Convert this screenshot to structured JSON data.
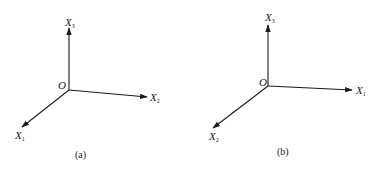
{
  "panels": [
    {
      "id": "a",
      "caption": "(a)",
      "origin_label": "O",
      "axes": [
        {
          "letter": "X",
          "subscript": "3",
          "direction": "up"
        },
        {
          "letter": "X",
          "subscript": "2",
          "direction": "right"
        },
        {
          "letter": "X",
          "subscript": "1",
          "direction": "down-left"
        }
      ]
    },
    {
      "id": "b",
      "caption": "(b)",
      "origin_label": "O",
      "axes": [
        {
          "letter": "X",
          "subscript": "3",
          "direction": "up"
        },
        {
          "letter": "X",
          "subscript": "1",
          "direction": "right"
        },
        {
          "letter": "X",
          "subscript": "2",
          "direction": "down-left"
        }
      ]
    }
  ],
  "colors": {
    "ink": "#1a1a1a",
    "background": "#ffffff"
  }
}
